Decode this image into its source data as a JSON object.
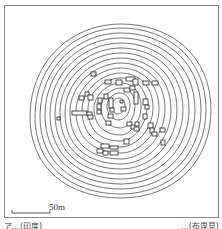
{
  "map": {
    "type": "topographic contour site plan",
    "contour_count": 16,
    "center": [
      121,
      106
    ],
    "outer_extent": {
      "x": [
        29,
        211
      ],
      "y": [
        24,
        198
      ]
    },
    "stroke_color": "#3a3a3a",
    "features": "dwelling/structure rectangles clustered around mound summit"
  },
  "scale_bar": {
    "label": "50m",
    "length_px": 38
  },
  "captions": {
    "left": "ア…(印度)",
    "right": "…(布毘見)"
  }
}
